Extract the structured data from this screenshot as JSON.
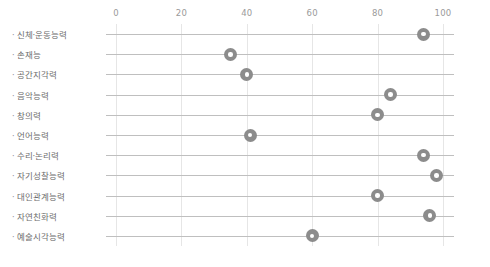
{
  "chart_data": {
    "type": "scatter",
    "title": "",
    "subtitle": "",
    "xlabel": "",
    "ylabel": "",
    "orientation": "horizontal",
    "xlim": [
      0,
      105
    ],
    "xticks": [
      0,
      20,
      40,
      60,
      80,
      100
    ],
    "xtick_labels": [
      "0",
      "20",
      "40",
      "60",
      "80",
      "100"
    ],
    "grid": "vertical-and-category-lines",
    "legend": "none",
    "marker": "donut",
    "marker_color": "#8c8c8c",
    "marker_inner_color": "#ffffff",
    "gridline_color": "#e6e6e6",
    "category_line_color": "#bfbfbf",
    "label_color": "#6d6d6d",
    "tick_color": "#9a9a9a",
    "categories": [
      "신체·운동능력",
      "손재능",
      "공간지각력",
      "음악능력",
      "창의력",
      "언어능력",
      "수리·논리력",
      "자기성찰능력",
      "대인관계능력",
      "자연친화력",
      "예술시각능력"
    ],
    "values": [
      94,
      35,
      40,
      84,
      80,
      41,
      94,
      98,
      80,
      96,
      60
    ],
    "points": [
      {
        "category": "신체·운동능력",
        "value": 94
      },
      {
        "category": "손재능",
        "value": 35
      },
      {
        "category": "공간지각력",
        "value": 40
      },
      {
        "category": "음악능력",
        "value": 84
      },
      {
        "category": "창의력",
        "value": 80
      },
      {
        "category": "언어능력",
        "value": 41
      },
      {
        "category": "수리·논리력",
        "value": 94
      },
      {
        "category": "자기성찰능력",
        "value": 98
      },
      {
        "category": "대인관계능력",
        "value": 80
      },
      {
        "category": "자연친화력",
        "value": 96
      },
      {
        "category": "예술시각능력",
        "value": 60
      }
    ]
  },
  "axis": {
    "bullet": "·"
  }
}
